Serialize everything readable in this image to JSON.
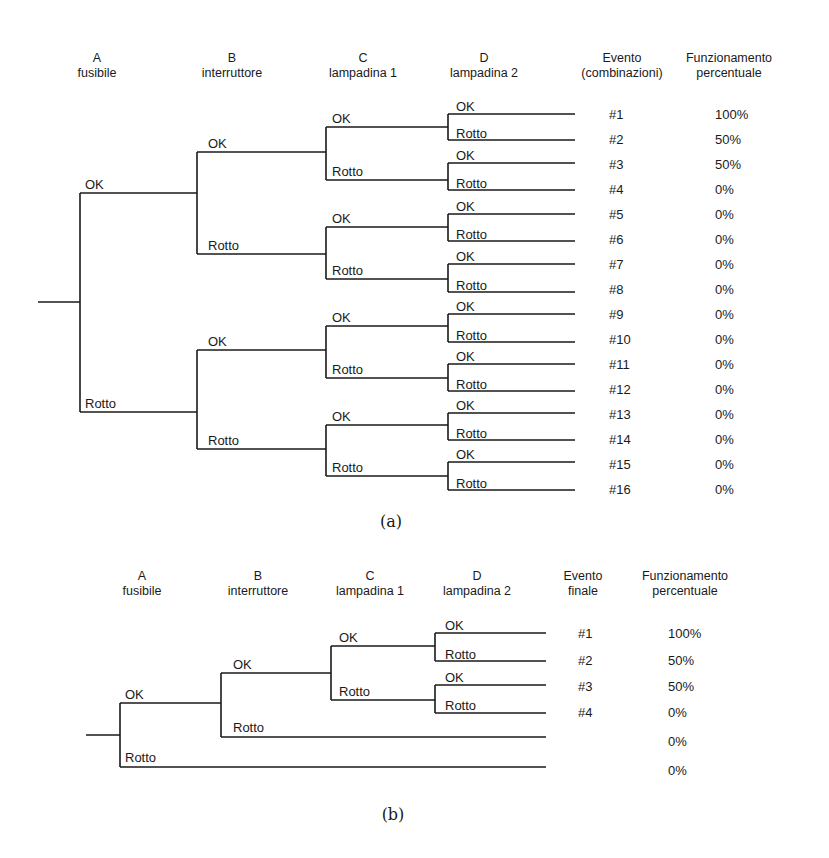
{
  "figure_a": {
    "caption": "(a)",
    "headers": [
      {
        "line1": "A",
        "line2": "fusibile"
      },
      {
        "line1": "B",
        "line2": "interruttore"
      },
      {
        "line1": "C",
        "line2": "lampadina 1"
      },
      {
        "line1": "D",
        "line2": "lampadina 2"
      },
      {
        "line1": "Evento",
        "line2": "(combinazioni)"
      },
      {
        "line1": "Funzionamento",
        "line2": "percentuale"
      }
    ],
    "branch_labels": {
      "ok": "OK",
      "broken": "Rotto"
    },
    "outcomes": [
      {
        "event": "#1",
        "percent": "100%"
      },
      {
        "event": "#2",
        "percent": "50%"
      },
      {
        "event": "#3",
        "percent": "50%"
      },
      {
        "event": "#4",
        "percent": "0%"
      },
      {
        "event": "#5",
        "percent": "0%"
      },
      {
        "event": "#6",
        "percent": "0%"
      },
      {
        "event": "#7",
        "percent": "0%"
      },
      {
        "event": "#8",
        "percent": "0%"
      },
      {
        "event": "#9",
        "percent": "0%"
      },
      {
        "event": "#10",
        "percent": "0%"
      },
      {
        "event": "#11",
        "percent": "0%"
      },
      {
        "event": "#12",
        "percent": "0%"
      },
      {
        "event": "#13",
        "percent": "0%"
      },
      {
        "event": "#14",
        "percent": "0%"
      },
      {
        "event": "#15",
        "percent": "0%"
      },
      {
        "event": "#16",
        "percent": "0%"
      }
    ]
  },
  "figure_b": {
    "caption": "(b)",
    "headers": [
      {
        "line1": "A",
        "line2": "fusibile"
      },
      {
        "line1": "B",
        "line2": "interruttore"
      },
      {
        "line1": "C",
        "line2": "lampadina 1"
      },
      {
        "line1": "D",
        "line2": "lampadina 2"
      },
      {
        "line1": "Evento",
        "line2": "finale"
      },
      {
        "line1": "Funzionamento",
        "line2": "percentuale"
      }
    ],
    "branch_labels": {
      "ok": "OK",
      "broken": "Rotto"
    },
    "outcomes": [
      {
        "event": "#1",
        "percent": "100%"
      },
      {
        "event": "#2",
        "percent": "50%"
      },
      {
        "event": "#3",
        "percent": "50%"
      },
      {
        "event": "#4",
        "percent": "0%"
      },
      {
        "event": "",
        "percent": "0%"
      },
      {
        "event": "",
        "percent": "0%"
      }
    ]
  }
}
